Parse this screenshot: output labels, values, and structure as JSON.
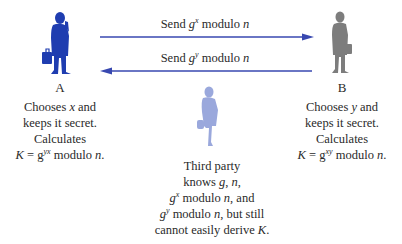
{
  "colors": {
    "party_a": "#1f3db0",
    "party_b": "#7d7d7d",
    "third_party": "#9aa8dc",
    "arrow": "#3848b0",
    "text": "#2a2a2a"
  },
  "party_a": {
    "label": "A",
    "description": [
      "Chooses x and",
      "keeps it secret.",
      "Calculates",
      "K = g^yx modulo n."
    ],
    "parts": {
      "line1_pre": "Chooses ",
      "line1_var": "x",
      "line1_post": " and",
      "line2": "keeps it secret.",
      "line3": "Calculates",
      "line4_K": "K",
      "line4_eq": " = g",
      "line4_exp": "yx",
      "line4_post": " modulo ",
      "line4_n": "n",
      "line4_end": "."
    }
  },
  "party_b": {
    "label": "B",
    "description": [
      "Chooses y and",
      "keeps it secret.",
      "Calculates",
      "K = g^xy modulo n."
    ],
    "parts": {
      "line1_pre": "Chooses ",
      "line1_var": "y",
      "line1_post": " and",
      "line2": "keeps it secret.",
      "line3": "Calculates",
      "line4_K": "K",
      "line4_eq": " = g",
      "line4_exp": "xy",
      "line4_post": " modulo ",
      "line4_n": "n",
      "line4_end": "."
    }
  },
  "messages": [
    {
      "text": "Send g^x modulo n",
      "direction": "A-to-B",
      "pre": "Send ",
      "g": "g",
      "exp": "x",
      "post": " modulo ",
      "n": "n"
    },
    {
      "text": "Send g^y modulo n",
      "direction": "B-to-A",
      "pre": "Send ",
      "g": "g",
      "exp": "y",
      "post": " modulo ",
      "n": "n"
    }
  ],
  "third_party": {
    "description": [
      "Third party",
      "knows g, n,",
      "g^x modulo n, and",
      "g^y modulo n, but still",
      "cannot easily derive K."
    ],
    "parts": {
      "line1": "Third party",
      "line2_pre": "knows ",
      "line2_g": "g",
      "line2_mid": ", ",
      "line2_n": "n",
      "line2_end": ",",
      "line3_g": "g",
      "line3_exp": "x",
      "line3_post": " modulo ",
      "line3_n": "n",
      "line3_end": ", and",
      "line4_g": "g",
      "line4_exp": "y",
      "line4_post": " modulo ",
      "line4_n": "n",
      "line4_end": ", but still",
      "line5_pre": "cannot easily derive ",
      "line5_K": "K",
      "line5_end": "."
    }
  }
}
